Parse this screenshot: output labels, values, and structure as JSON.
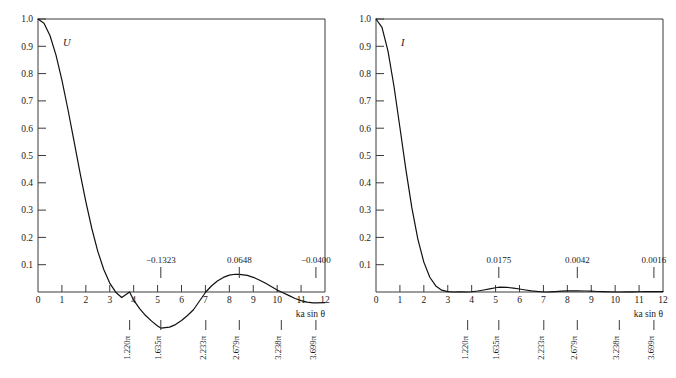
{
  "figure": {
    "background": "#ffffff",
    "curve_color": "#111111",
    "axis_color": "#3a3a3a"
  },
  "panels": [
    {
      "id": "left",
      "curve_label": "U",
      "quantity": "amplitude",
      "xlabel": "ka sin θ",
      "y_ticks": [
        "1.0",
        "0.9",
        "0.8",
        "0.7",
        "0.6",
        "0.5",
        "0.4",
        "0.3",
        "0.2",
        "0.1"
      ],
      "y_tick_values": [
        1.0,
        0.9,
        0.8,
        0.7,
        0.6,
        0.5,
        0.4,
        0.3,
        0.2,
        0.1
      ],
      "x_ticks": [
        "0",
        "1",
        "2",
        "3",
        "4",
        "5",
        "6",
        "7",
        "8",
        "9",
        "10",
        "11",
        "12"
      ],
      "x_tick_values": [
        0,
        1,
        2,
        3,
        4,
        5,
        6,
        7,
        8,
        9,
        10,
        11,
        12
      ],
      "annotations": [
        {
          "label": "−0.1323",
          "x": 5.135,
          "value": -0.1323
        },
        {
          "label": "0.0648",
          "x": 8.417,
          "value": 0.0648
        },
        {
          "label": "−0.0400",
          "x": 11.62,
          "value": -0.04
        }
      ],
      "pi_ticks": [
        {
          "label": "1.220π",
          "x": 3.8317
        },
        {
          "label": "1.635π",
          "x": 5.1356
        },
        {
          "label": "2.233π",
          "x": 7.0156
        },
        {
          "label": "2.679π",
          "x": 8.4172
        },
        {
          "label": "3.238π",
          "x": 10.1735
        },
        {
          "label": "3.699π",
          "x": 11.6198
        }
      ]
    },
    {
      "id": "right",
      "curve_label": "I",
      "quantity": "intensity",
      "xlabel": "ka sin θ",
      "y_ticks": [
        "1.0",
        "0.9",
        "0.8",
        "0.7",
        "0.6",
        "0.5",
        "0.4",
        "0.3",
        "0.2",
        "0.1"
      ],
      "y_tick_values": [
        1.0,
        0.9,
        0.8,
        0.7,
        0.6,
        0.5,
        0.4,
        0.3,
        0.2,
        0.1
      ],
      "x_ticks": [
        "0",
        "1",
        "2",
        "3",
        "4",
        "5",
        "6",
        "7",
        "8",
        "9",
        "10",
        "11",
        "12"
      ],
      "x_tick_values": [
        0,
        1,
        2,
        3,
        4,
        5,
        6,
        7,
        8,
        9,
        10,
        11,
        12
      ],
      "annotations": [
        {
          "label": "0.0175",
          "x": 5.135,
          "value": 0.0175
        },
        {
          "label": "0.0042",
          "x": 8.417,
          "value": 0.0042
        },
        {
          "label": "0.0016",
          "x": 11.62,
          "value": 0.0016
        }
      ],
      "pi_ticks": [
        {
          "label": "1.220π",
          "x": 3.8317
        },
        {
          "label": "1.635π",
          "x": 5.1356
        },
        {
          "label": "2.233π",
          "x": 7.0156
        },
        {
          "label": "2.679π",
          "x": 8.4172
        },
        {
          "label": "3.238π",
          "x": 10.1735
        },
        {
          "label": "3.699π",
          "x": 11.6198
        }
      ]
    }
  ],
  "chart_data": [
    {
      "type": "line",
      "panel": "left",
      "title": "",
      "xlabel": "ka sin θ",
      "ylabel": "U",
      "xlim": [
        0,
        12
      ],
      "ylim": [
        -0.15,
        1.0
      ],
      "grid": false,
      "legend": "none",
      "series": [
        {
          "name": "U = 2J1(x)/x",
          "x": [
            0,
            0.25,
            0.5,
            0.75,
            1,
            1.25,
            1.5,
            1.75,
            2,
            2.25,
            2.5,
            2.75,
            3,
            3.25,
            3.5,
            3.8317,
            4,
            4.25,
            4.5,
            4.75,
            5,
            5.1356,
            5.5,
            5.75,
            6,
            6.25,
            6.5,
            7.0156,
            7.25,
            7.5,
            7.75,
            8,
            8.25,
            8.4172,
            8.75,
            9,
            9.25,
            9.5,
            10,
            10.1735,
            10.5,
            10.75,
            11,
            11.25,
            11.5,
            11.6198,
            12
          ],
          "y": [
            1.0,
            0.9845,
            0.9397,
            0.8686,
            0.7763,
            0.6694,
            0.5551,
            0.4401,
            0.3309,
            0.2326,
            0.149,
            0.0822,
            0.0327,
            -0.0007,
            -0.0202,
            0.0,
            -0.03,
            -0.0612,
            -0.0862,
            -0.1067,
            -0.1245,
            -0.1323,
            -0.1288,
            -0.1195,
            -0.1046,
            -0.0859,
            -0.065,
            0.0,
            0.022,
            0.04,
            0.0534,
            0.0618,
            0.065,
            0.0648,
            0.0608,
            0.0538,
            0.0441,
            0.0327,
            0.007,
            0.0,
            -0.0133,
            -0.0238,
            -0.0318,
            -0.0371,
            -0.0396,
            -0.04,
            -0.0386
          ]
        }
      ],
      "annotation_points": [
        {
          "label": "−0.1323",
          "x": 5.1356,
          "y": -0.1323
        },
        {
          "label": "0.0648",
          "x": 8.4172,
          "y": 0.0648
        },
        {
          "label": "−0.0400",
          "x": 11.6198,
          "y": -0.04
        }
      ],
      "secondary_xaxis_ticks": [
        {
          "label": "1.220π",
          "x": 3.8317
        },
        {
          "label": "1.635π",
          "x": 5.1356
        },
        {
          "label": "2.233π",
          "x": 7.0156
        },
        {
          "label": "2.679π",
          "x": 8.4172
        },
        {
          "label": "3.238π",
          "x": 10.1735
        },
        {
          "label": "3.699π",
          "x": 11.6198
        }
      ]
    },
    {
      "type": "line",
      "panel": "right",
      "title": "",
      "xlabel": "ka sin θ",
      "ylabel": "I",
      "xlim": [
        0,
        12
      ],
      "ylim": [
        0,
        1.0
      ],
      "grid": false,
      "legend": "none",
      "series": [
        {
          "name": "I = (2J1(x)/x)^2",
          "x": [
            0,
            0.25,
            0.5,
            0.75,
            1,
            1.25,
            1.5,
            1.75,
            2,
            2.25,
            2.5,
            2.75,
            3,
            3.25,
            3.5,
            3.8317,
            4,
            4.25,
            4.5,
            4.75,
            5,
            5.1356,
            5.5,
            5.75,
            6,
            6.25,
            6.5,
            7.0156,
            7.25,
            7.5,
            7.75,
            8,
            8.25,
            8.4172,
            8.75,
            9,
            9.25,
            9.5,
            10,
            10.1735,
            10.5,
            10.75,
            11,
            11.25,
            11.5,
            11.6198,
            12
          ],
          "y": [
            1.0,
            0.9692,
            0.8831,
            0.7545,
            0.6026,
            0.4481,
            0.3081,
            0.1937,
            0.1095,
            0.0541,
            0.0222,
            0.0068,
            0.0011,
            0.0,
            0.0004,
            0.0,
            0.0009,
            0.0037,
            0.0074,
            0.0114,
            0.0155,
            0.0175,
            0.0166,
            0.0143,
            0.0109,
            0.0074,
            0.0042,
            0.0,
            0.0005,
            0.0016,
            0.0029,
            0.0038,
            0.0042,
            0.0042,
            0.0037,
            0.0029,
            0.0019,
            0.0011,
            5e-05,
            0.0,
            0.0002,
            0.0006,
            0.001,
            0.0014,
            0.0016,
            0.0016,
            0.0015
          ]
        }
      ],
      "annotation_points": [
        {
          "label": "0.0175",
          "x": 5.1356,
          "y": 0.0175
        },
        {
          "label": "0.0042",
          "x": 8.4172,
          "y": 0.0042
        },
        {
          "label": "0.0016",
          "x": 11.6198,
          "y": 0.0016
        }
      ],
      "secondary_xaxis_ticks": [
        {
          "label": "1.220π",
          "x": 3.8317
        },
        {
          "label": "1.635π",
          "x": 5.1356
        },
        {
          "label": "2.233π",
          "x": 7.0156
        },
        {
          "label": "2.679π",
          "x": 8.4172
        },
        {
          "label": "3.238π",
          "x": 10.1735
        },
        {
          "label": "3.699π",
          "x": 11.6198
        }
      ]
    }
  ]
}
